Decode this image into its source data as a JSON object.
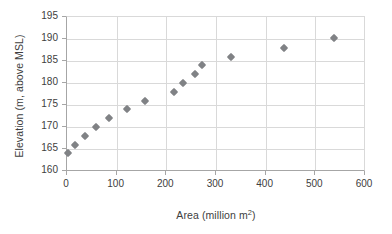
{
  "chart_data": {
    "type": "scatter",
    "title": "",
    "xlabel": "Area (million m2)",
    "xlabel_base": "Area (million m",
    "xlabel_sup": "2",
    "xlabel_tail": ")",
    "ylabel": "Elevation (m, above MSL)",
    "xlim": [
      0,
      600
    ],
    "ylim": [
      160,
      195
    ],
    "xticks": [
      0,
      100,
      200,
      300,
      400,
      500,
      600
    ],
    "yticks": [
      160,
      165,
      170,
      175,
      180,
      185,
      190,
      195
    ],
    "xtick_labels": [
      "0",
      "100",
      "200",
      "300",
      "400",
      "500",
      "600"
    ],
    "ytick_labels": [
      "160",
      "165",
      "170",
      "175",
      "180",
      "185",
      "190",
      "195"
    ],
    "grid": "both",
    "legend": "none",
    "marker": {
      "shape": "diamond",
      "color": "#808285",
      "size": 6
    },
    "series": [
      {
        "name": "Area-Elevation curve",
        "points": [
          {
            "x": 2,
            "y": 164.0
          },
          {
            "x": 17,
            "y": 166.0
          },
          {
            "x": 37,
            "y": 168.0
          },
          {
            "x": 58,
            "y": 170.0
          },
          {
            "x": 85,
            "y": 172.0
          },
          {
            "x": 120,
            "y": 174.0
          },
          {
            "x": 158,
            "y": 176.0
          },
          {
            "x": 215,
            "y": 178.0
          },
          {
            "x": 233,
            "y": 180.0
          },
          {
            "x": 258,
            "y": 182.0
          },
          {
            "x": 271,
            "y": 184.0
          },
          {
            "x": 331,
            "y": 186.0
          },
          {
            "x": 436,
            "y": 188.0
          },
          {
            "x": 538,
            "y": 190.2
          }
        ]
      }
    ]
  },
  "colors": {
    "marker": "#808285",
    "gridline": "#d9d9d9",
    "axis": "#a6a6a6",
    "text": "#404040",
    "background": "#ffffff"
  }
}
